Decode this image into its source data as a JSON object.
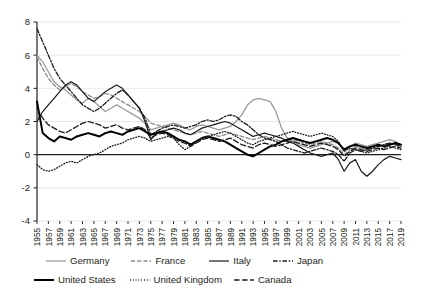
{
  "chart_data": {
    "type": "line",
    "title": "",
    "subtitle": "",
    "xlabel": "",
    "ylabel": "",
    "grid": true,
    "legend_position": "bottom",
    "ylim": [
      -4,
      8
    ],
    "yticks": [
      8,
      6,
      4,
      2,
      0,
      -2,
      -4
    ],
    "ytick_labels": [
      "8",
      "6",
      "4",
      "2",
      "0",
      "-2",
      "-4"
    ],
    "xlim": [
      1955,
      2019
    ],
    "xticks": [
      1955,
      1957,
      1959,
      1961,
      1963,
      1965,
      1967,
      1969,
      1971,
      1973,
      1975,
      1977,
      1979,
      1981,
      1983,
      1985,
      1987,
      1989,
      1991,
      1993,
      1995,
      1997,
      1999,
      2001,
      2003,
      2005,
      2007,
      2009,
      2011,
      2013,
      2015,
      2017,
      2019
    ],
    "xtick_labels": [
      "1955",
      "1957",
      "1959",
      "1961",
      "1963",
      "1965",
      "1967",
      "1969",
      "1971",
      "1973",
      "1975",
      "1977",
      "1979",
      "1981",
      "1983",
      "1985",
      "1987",
      "1989",
      "1991",
      "1993",
      "1995",
      "1997",
      "1999",
      "2001",
      "2003",
      "2005",
      "2007",
      "2009",
      "2011",
      "2013",
      "2015",
      "2017",
      "2019"
    ],
    "x": [
      1955,
      1956,
      1957,
      1958,
      1959,
      1960,
      1961,
      1962,
      1963,
      1964,
      1965,
      1966,
      1967,
      1968,
      1969,
      1970,
      1971,
      1972,
      1973,
      1974,
      1975,
      1976,
      1977,
      1978,
      1979,
      1980,
      1981,
      1982,
      1983,
      1984,
      1985,
      1986,
      1987,
      1988,
      1989,
      1990,
      1991,
      1992,
      1993,
      1994,
      1995,
      1996,
      1997,
      1998,
      1999,
      2000,
      2001,
      2002,
      2003,
      2004,
      2005,
      2006,
      2007,
      2008,
      2009,
      2010,
      2011,
      2012,
      2013,
      2014,
      2015,
      2016,
      2017,
      2018,
      2019
    ],
    "series": [
      {
        "name": "Germany",
        "style": "solid",
        "color": "#9a9a9a",
        "width": 1.3,
        "values": [
          6.0,
          5.6,
          5.0,
          4.4,
          4.1,
          3.9,
          3.6,
          3.3,
          3.1,
          3.4,
          3.2,
          2.9,
          2.6,
          2.8,
          3.0,
          2.8,
          2.6,
          2.4,
          2.2,
          1.9,
          1.5,
          1.6,
          1.7,
          1.8,
          1.9,
          1.8,
          1.6,
          1.5,
          1.7,
          1.8,
          1.7,
          1.6,
          1.5,
          1.6,
          1.7,
          2.0,
          2.4,
          3.0,
          3.3,
          3.4,
          3.3,
          3.2,
          2.6,
          1.6,
          1.0,
          0.8,
          0.6,
          0.5,
          0.4,
          0.5,
          0.6,
          0.7,
          0.8,
          0.7,
          0.2,
          0.5,
          0.7,
          0.6,
          0.5,
          0.6,
          0.7,
          0.8,
          0.9,
          0.8,
          0.6
        ]
      },
      {
        "name": "France",
        "style": "dashed",
        "color": "#8c8c8c",
        "width": 1.3,
        "values": [
          5.9,
          5.2,
          4.6,
          4.2,
          3.9,
          4.1,
          4.3,
          4.1,
          3.8,
          3.6,
          3.4,
          3.5,
          3.7,
          3.6,
          3.4,
          3.2,
          3.0,
          2.8,
          2.6,
          2.3,
          1.9,
          1.8,
          1.7,
          1.6,
          1.5,
          1.4,
          1.3,
          1.2,
          1.3,
          1.4,
          1.3,
          1.2,
          1.1,
          1.2,
          1.3,
          1.2,
          1.1,
          1.0,
          0.9,
          1.0,
          1.1,
          1.0,
          0.9,
          0.8,
          0.8,
          0.9,
          0.8,
          0.7,
          0.6,
          0.7,
          0.8,
          0.7,
          0.6,
          0.4,
          0.0,
          0.3,
          0.5,
          0.4,
          0.3,
          0.4,
          0.5,
          0.6,
          0.7,
          0.6,
          0.5
        ]
      },
      {
        "name": "Italy",
        "style": "solid",
        "color": "#1a1a1a",
        "width": 1.2,
        "values": [
          2.0,
          2.6,
          3.0,
          3.4,
          3.8,
          4.2,
          4.4,
          4.2,
          3.8,
          3.4,
          3.2,
          3.5,
          3.8,
          4.0,
          4.2,
          4.0,
          3.6,
          3.2,
          2.8,
          2.0,
          0.9,
          1.3,
          1.4,
          1.5,
          1.6,
          1.5,
          1.3,
          1.2,
          1.4,
          1.6,
          1.7,
          1.8,
          1.9,
          2.0,
          1.9,
          1.7,
          1.5,
          1.3,
          1.1,
          1.2,
          1.3,
          1.2,
          1.1,
          1.0,
          0.8,
          0.7,
          0.5,
          0.3,
          0.1,
          0.0,
          -0.1,
          0.0,
          0.1,
          -0.3,
          -1.0,
          -0.5,
          -0.3,
          -1.0,
          -1.3,
          -1.0,
          -0.6,
          -0.3,
          -0.1,
          -0.2,
          -0.3
        ]
      },
      {
        "name": "Japan",
        "style": "dashdot",
        "color": "#1a1a1a",
        "width": 1.3,
        "values": [
          7.6,
          6.8,
          6.0,
          5.2,
          4.6,
          4.2,
          3.8,
          3.4,
          3.0,
          2.8,
          2.6,
          2.8,
          3.1,
          3.4,
          3.7,
          3.9,
          3.6,
          3.2,
          2.8,
          2.2,
          1.2,
          1.4,
          1.6,
          1.7,
          1.8,
          1.7,
          1.6,
          1.7,
          1.8,
          2.0,
          2.1,
          2.0,
          2.1,
          2.3,
          2.4,
          2.3,
          2.0,
          1.8,
          1.5,
          1.2,
          1.0,
          0.9,
          0.8,
          0.6,
          0.4,
          0.3,
          0.2,
          0.1,
          0.2,
          0.3,
          0.4,
          0.3,
          0.2,
          0.0,
          -0.4,
          0.1,
          0.3,
          0.2,
          0.3,
          0.4,
          0.5,
          0.6,
          0.7,
          0.6,
          0.5
        ]
      },
      {
        "name": "United States",
        "style": "solid",
        "color": "#000000",
        "width": 2.0,
        "values": [
          3.2,
          1.3,
          1.0,
          0.8,
          1.1,
          1.0,
          0.9,
          1.1,
          1.2,
          1.3,
          1.2,
          1.1,
          1.3,
          1.4,
          1.3,
          1.2,
          1.4,
          1.5,
          1.6,
          1.4,
          1.2,
          1.3,
          1.4,
          1.3,
          1.1,
          0.9,
          0.8,
          0.6,
          0.8,
          1.0,
          1.1,
          1.0,
          0.9,
          0.8,
          0.6,
          0.4,
          0.2,
          0.0,
          -0.1,
          0.1,
          0.3,
          0.5,
          0.6,
          0.8,
          0.9,
          1.0,
          0.9,
          0.8,
          0.7,
          0.8,
          0.9,
          1.0,
          0.9,
          0.7,
          0.3,
          0.5,
          0.6,
          0.5,
          0.4,
          0.5,
          0.6,
          0.5,
          0.6,
          0.7,
          0.6
        ]
      },
      {
        "name": "United Kingdom",
        "style": "dotted",
        "color": "#1a1a1a",
        "width": 1.3,
        "values": [
          -0.6,
          -0.9,
          -1.0,
          -0.9,
          -0.7,
          -0.5,
          -0.4,
          -0.5,
          -0.3,
          -0.1,
          0.0,
          0.1,
          0.3,
          0.5,
          0.6,
          0.7,
          0.9,
          1.0,
          1.1,
          1.0,
          0.8,
          0.9,
          1.0,
          1.1,
          1.0,
          0.6,
          0.3,
          0.5,
          0.8,
          1.0,
          1.1,
          1.2,
          1.3,
          1.4,
          1.3,
          1.1,
          0.9,
          0.7,
          0.6,
          0.8,
          0.9,
          1.0,
          1.1,
          1.2,
          1.3,
          1.4,
          1.3,
          1.2,
          1.1,
          1.2,
          1.3,
          1.2,
          1.1,
          0.8,
          0.2,
          0.4,
          0.3,
          0.2,
          0.1,
          0.2,
          0.3,
          0.4,
          0.5,
          0.4,
          0.3
        ]
      },
      {
        "name": "Canada",
        "style": "longdash",
        "color": "#1a1a1a",
        "width": 1.3,
        "values": [
          2.8,
          2.2,
          1.8,
          1.6,
          1.4,
          1.3,
          1.5,
          1.7,
          1.9,
          2.0,
          1.9,
          1.8,
          1.6,
          1.7,
          1.8,
          1.6,
          1.5,
          1.6,
          1.7,
          1.5,
          1.0,
          1.2,
          1.3,
          1.2,
          1.0,
          0.8,
          0.7,
          0.5,
          0.7,
          0.9,
          1.0,
          0.9,
          0.8,
          0.9,
          1.0,
          0.8,
          0.6,
          0.5,
          0.4,
          0.6,
          0.7,
          0.6,
          0.5,
          0.6,
          0.7,
          0.8,
          0.7,
          0.6,
          0.5,
          0.6,
          0.7,
          0.6,
          0.5,
          0.3,
          -0.1,
          0.2,
          0.4,
          0.3,
          0.2,
          0.3,
          0.4,
          0.3,
          0.4,
          0.5,
          0.4
        ]
      }
    ]
  },
  "legend": {
    "rows": [
      [
        {
          "label": "Germany",
          "series": 0
        },
        {
          "label": "France",
          "series": 1
        },
        {
          "label": "Italy",
          "series": 2
        },
        {
          "label": "Japan",
          "series": 3
        }
      ],
      [
        {
          "label": "United States",
          "series": 4
        },
        {
          "label": "United Kingdom",
          "series": 5
        },
        {
          "label": "Canada",
          "series": 6
        }
      ]
    ]
  },
  "colors": {
    "grid": "#e8e8e8",
    "axis": "#231f20",
    "zero_line": "#231f20",
    "background": "#ffffff"
  }
}
